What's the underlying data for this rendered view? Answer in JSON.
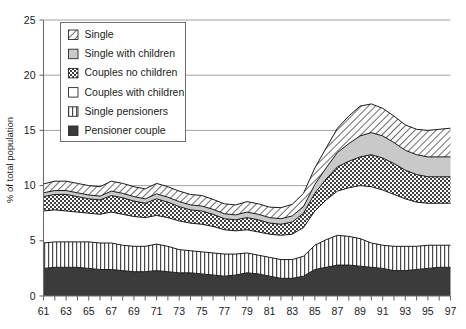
{
  "chart_data": {
    "type": "area",
    "title": "",
    "subtitle": "",
    "xlabel": "",
    "ylabel": "% of total population",
    "xlim": [
      61,
      97
    ],
    "ylim": [
      0,
      25
    ],
    "yticks": [
      0,
      5,
      10,
      15,
      20,
      25
    ],
    "ytick_labels": [
      "0",
      "5",
      "10",
      "15",
      "20",
      "25"
    ],
    "grid": "horizontal",
    "stacked": true,
    "legend_position": "upper-left-inside",
    "x": [
      61,
      62,
      63,
      64,
      65,
      66,
      67,
      68,
      69,
      70,
      71,
      72,
      73,
      74,
      75,
      76,
      77,
      78,
      79,
      80,
      81,
      82,
      83,
      84,
      85,
      86,
      87,
      88,
      89,
      90,
      91,
      92,
      93,
      94,
      95,
      96,
      97
    ],
    "xtick_labels": [
      "61",
      "",
      "63",
      "",
      "65",
      "",
      "67",
      "",
      "69",
      "",
      "71",
      "",
      "73",
      "",
      "75",
      "",
      "77",
      "",
      "79",
      "",
      "81",
      "",
      "83",
      "",
      "85",
      "",
      "87",
      "",
      "89",
      "",
      "91",
      "",
      "93",
      "",
      "95",
      "",
      "97"
    ],
    "series": [
      {
        "name": "Pensioner couple",
        "fill": "solid-dark",
        "color": "#3b3b3b",
        "values": [
          2.5,
          2.6,
          2.6,
          2.6,
          2.5,
          2.4,
          2.4,
          2.3,
          2.2,
          2.2,
          2.3,
          2.2,
          2.1,
          2.1,
          2.0,
          1.9,
          1.8,
          1.9,
          2.1,
          2.0,
          1.8,
          1.6,
          1.6,
          1.8,
          2.4,
          2.6,
          2.8,
          2.8,
          2.7,
          2.6,
          2.5,
          2.3,
          2.3,
          2.4,
          2.5,
          2.6,
          2.6
        ]
      },
      {
        "name": "Single pensioners",
        "fill": "vertical-lines",
        "color": "#e8e8e8",
        "values": [
          2.3,
          2.3,
          2.3,
          2.3,
          2.4,
          2.4,
          2.4,
          2.3,
          2.3,
          2.3,
          2.4,
          2.3,
          2.1,
          2.0,
          2.0,
          2.0,
          2.0,
          1.9,
          1.8,
          1.7,
          1.7,
          1.7,
          1.7,
          1.8,
          2.2,
          2.5,
          2.7,
          2.6,
          2.5,
          2.2,
          2.1,
          2.2,
          2.2,
          2.1,
          2.1,
          2.0,
          2.0
        ]
      },
      {
        "name": "Couples with children",
        "fill": "white",
        "color": "#ffffff",
        "values": [
          2.9,
          2.9,
          2.8,
          2.7,
          2.6,
          2.6,
          2.8,
          2.8,
          2.7,
          2.6,
          2.6,
          2.6,
          2.6,
          2.5,
          2.5,
          2.4,
          2.2,
          2.1,
          2.1,
          2.1,
          2.1,
          2.2,
          2.3,
          2.6,
          3.1,
          3.6,
          4.0,
          4.4,
          4.8,
          5.1,
          5.0,
          4.7,
          4.3,
          4.0,
          3.8,
          3.8,
          3.8
        ]
      },
      {
        "name": "Couples no children",
        "fill": "checker",
        "color": "#6e6e6e",
        "values": [
          1.3,
          1.4,
          1.5,
          1.4,
          1.3,
          1.3,
          1.5,
          1.5,
          1.4,
          1.3,
          1.5,
          1.4,
          1.3,
          1.2,
          1.2,
          1.1,
          1.0,
          1.0,
          1.1,
          1.1,
          1.0,
          1.0,
          1.1,
          1.3,
          1.6,
          1.9,
          2.2,
          2.4,
          2.6,
          2.9,
          2.9,
          2.8,
          2.6,
          2.5,
          2.4,
          2.4,
          2.4
        ]
      },
      {
        "name": "Single with children",
        "fill": "solid-light",
        "color": "#c9c9c9",
        "values": [
          0.35,
          0.35,
          0.35,
          0.35,
          0.35,
          0.35,
          0.4,
          0.4,
          0.4,
          0.4,
          0.45,
          0.45,
          0.45,
          0.45,
          0.45,
          0.45,
          0.45,
          0.45,
          0.5,
          0.5,
          0.5,
          0.5,
          0.55,
          0.6,
          0.8,
          1.0,
          1.3,
          1.6,
          1.9,
          2.0,
          2.0,
          1.9,
          1.8,
          1.8,
          1.8,
          1.8,
          1.8
        ]
      },
      {
        "name": "Single",
        "fill": "diagonal-hatch",
        "color": "#f0f0f0",
        "values": [
          0.8,
          0.85,
          0.85,
          0.85,
          0.85,
          0.85,
          0.9,
          0.9,
          0.9,
          0.9,
          0.95,
          0.95,
          0.95,
          0.95,
          0.95,
          0.9,
          0.9,
          0.9,
          0.95,
          0.95,
          0.95,
          1.0,
          1.05,
          1.2,
          1.5,
          1.8,
          2.2,
          2.5,
          2.7,
          2.6,
          2.5,
          2.4,
          2.3,
          2.3,
          2.4,
          2.5,
          2.6
        ]
      }
    ],
    "stack_totals": [
      10.15,
      10.4,
      10.4,
      10.2,
      10.0,
      9.9,
      10.4,
      10.2,
      9.9,
      9.7,
      10.2,
      9.9,
      9.5,
      9.2,
      9.1,
      8.75,
      8.35,
      8.25,
      8.55,
      8.35,
      8.05,
      7.95,
      8.3,
      9.3,
      11.6,
      13.4,
      15.2,
      16.3,
      17.2,
      17.4,
      17.0,
      16.3,
      15.5,
      15.1,
      15.0,
      15.1,
      15.2
    ]
  },
  "legend": {
    "items": [
      {
        "label": "Single",
        "swatch": "diagonal-hatch"
      },
      {
        "label": "Single with children",
        "swatch": "solid-light"
      },
      {
        "label": "Couples no children",
        "swatch": "checker"
      },
      {
        "label": "Couples with children",
        "swatch": "white"
      },
      {
        "label": "Single pensioners",
        "swatch": "vertical-lines"
      },
      {
        "label": "Pensioner couple",
        "swatch": "solid-dark"
      }
    ]
  },
  "axes": {
    "y_title": "% of total population",
    "y_ticks": [
      "25",
      "20",
      "15",
      "10",
      "5",
      "0"
    ],
    "x_ticks": [
      "61",
      "63",
      "65",
      "67",
      "69",
      "71",
      "73",
      "75",
      "77",
      "79",
      "81",
      "83",
      "85",
      "87",
      "89",
      "91",
      "93",
      "95",
      "97"
    ]
  }
}
